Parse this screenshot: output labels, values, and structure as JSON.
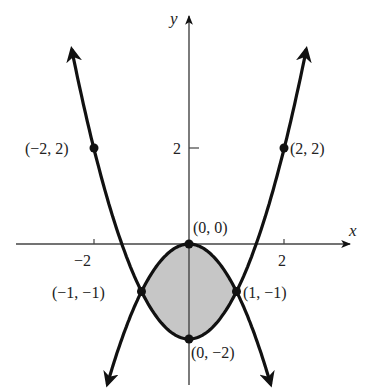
{
  "chart_data": {
    "type": "line",
    "title": "",
    "xlabel": "x",
    "ylabel": "y",
    "xlim": [
      -3.9,
      3.4
    ],
    "ylim": [
      -3.05,
      5.1
    ],
    "grid": false,
    "x_ticks": [
      {
        "value": -2,
        "label": "−2"
      },
      {
        "value": 2,
        "label": "2"
      }
    ],
    "y_ticks": [
      {
        "value": 2,
        "label": "2"
      }
    ],
    "series": [
      {
        "name": "y = x^2 - 2",
        "x": [
          -2.47,
          -2,
          -1,
          0,
          1,
          2,
          2.47
        ],
        "y": [
          4.1,
          2,
          -1,
          -2,
          -1,
          2,
          4.1
        ]
      },
      {
        "name": "y = -x^2",
        "x": [
          -1.72,
          -1,
          0,
          1,
          1.72
        ],
        "y": [
          -2.97,
          -1,
          0,
          -1,
          -2.97
        ]
      }
    ],
    "shaded_region": {
      "between": [
        "y = -x^2",
        "y = x^2 - 2"
      ],
      "x_range": [
        -1,
        1
      ],
      "color": "#c8c8c8"
    },
    "points": [
      {
        "x": -2,
        "y": 2,
        "label": "(−2, 2)"
      },
      {
        "x": 2,
        "y": 2,
        "label": "(2, 2)"
      },
      {
        "x": 0,
        "y": 0,
        "label": "(0, 0)"
      },
      {
        "x": -1,
        "y": -1,
        "label": "(−1, −1)"
      },
      {
        "x": 1,
        "y": -1,
        "label": "(1, −1)"
      },
      {
        "x": 0,
        "y": -2,
        "label": "(0, −2)"
      }
    ]
  },
  "labels": {
    "x_axis": "x",
    "y_axis": "y",
    "tick_x_neg2": "−2",
    "tick_x_2": "2",
    "tick_y_2": "2",
    "pt_neg2_2": "(−2, 2)",
    "pt_2_2": "(2, 2)",
    "pt_0_0": "(0, 0)",
    "pt_neg1_neg1": "(−1, −1)",
    "pt_1_neg1": "(1, −1)",
    "pt_0_neg2": "(0, −2)"
  }
}
